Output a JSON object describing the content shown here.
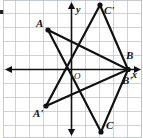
{
  "figure": {
    "title": "",
    "width": 143,
    "height": 138,
    "background_color": "#ffffff",
    "grid_color": "#b9bfc9",
    "axis_color": "#111111",
    "shape_color": "#111111",
    "grid_spacing_px": 14,
    "origin_px": {
      "x": 71.5,
      "y": 69.5
    }
  },
  "axes": {
    "x_label": "x",
    "y_label": "y",
    "origin_label": "O",
    "x_axis_y_px": 69.5,
    "y_axis_x_px": 71.5,
    "arrows": [
      "left",
      "right",
      "up",
      "down"
    ]
  },
  "chart_data": {
    "type": "scatter",
    "title": "",
    "xlabel": "x",
    "ylabel": "y",
    "grid": true,
    "legend": null,
    "xlim": [
      -5.1,
      5.1
    ],
    "ylim": [
      -5,
      4.9
    ],
    "series": [
      {
        "name": "Triangle ABC",
        "closed": true,
        "points": [
          {
            "label": "A",
            "x": -1.7,
            "y": 2.8,
            "px": 48,
            "py": 30
          },
          {
            "label": "B",
            "x": 4.0,
            "y": 0.0,
            "px": 128,
            "py": 69.5
          },
          {
            "label": "C",
            "x": 2.1,
            "y": -4.5,
            "px": 101,
            "py": 132
          }
        ]
      },
      {
        "name": "Triangle A'B'C'",
        "closed": true,
        "points": [
          {
            "label": "A'",
            "x": -1.8,
            "y": -2.6,
            "px": 46,
            "py": 106
          },
          {
            "label": "B'",
            "x": 4.0,
            "y": 0.0,
            "px": 128,
            "py": 69.5
          },
          {
            "label": "C'",
            "x": 2.0,
            "y": 4.6,
            "px": 100,
            "py": 5
          }
        ]
      }
    ],
    "vertex_labels": [
      {
        "id": "A",
        "text": "A",
        "px": 36,
        "py": 18
      },
      {
        "id": "Cp",
        "text": "C'",
        "px": 104,
        "py": 5
      },
      {
        "id": "B",
        "text": "B",
        "px": 126,
        "py": 50
      },
      {
        "id": "Bp",
        "text": "B'",
        "px": 122,
        "py": 75
      },
      {
        "id": "Ap",
        "text": "A'",
        "px": 33,
        "py": 108
      },
      {
        "id": "C",
        "text": "C",
        "px": 106,
        "py": 120
      }
    ]
  }
}
